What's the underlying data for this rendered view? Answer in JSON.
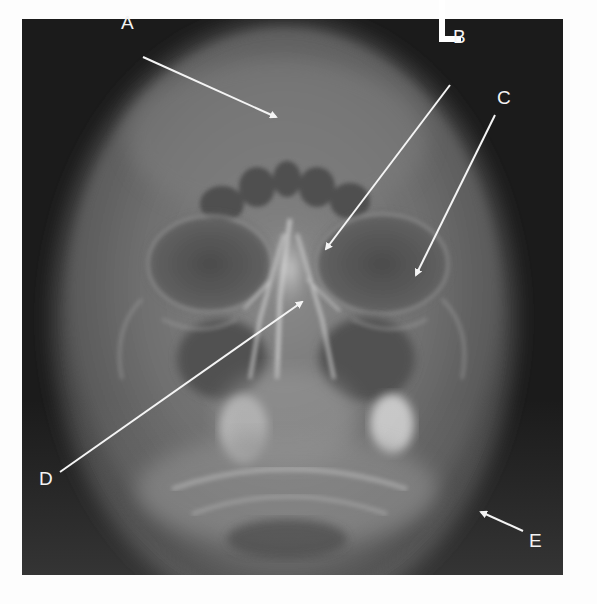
{
  "figure": {
    "type": "radiograph",
    "view": "skull, frontal projection",
    "side_marker": "L",
    "labels": [
      {
        "id": "A",
        "text": "A",
        "label_x": 121,
        "label_y": 13,
        "arrow_from": [
          143,
          57
        ],
        "arrow_to": [
          276,
          117
        ]
      },
      {
        "id": "B",
        "text": "B",
        "label_x": 453,
        "label_y": 27,
        "arrow_from": [
          450,
          85
        ],
        "arrow_to": [
          326,
          249
        ]
      },
      {
        "id": "C",
        "text": "C",
        "label_x": 497,
        "label_y": 88,
        "arrow_from": [
          495,
          115
        ],
        "arrow_to": [
          416,
          275
        ]
      },
      {
        "id": "D",
        "text": "D",
        "label_x": 39,
        "label_y": 469,
        "arrow_from": [
          60,
          472
        ],
        "arrow_to": [
          302,
          302
        ]
      },
      {
        "id": "E",
        "text": "E",
        "label_x": 529,
        "label_y": 531,
        "arrow_from": [
          523,
          531
        ],
        "arrow_to": [
          481,
          512
        ]
      }
    ]
  },
  "colors": {
    "background": "#fdfdfd",
    "film_dark": "#1b1b1b",
    "skull_soft": "#6e6e6e",
    "bone_bright": "#d8d8d8",
    "annotation": "#f4f4f4"
  }
}
